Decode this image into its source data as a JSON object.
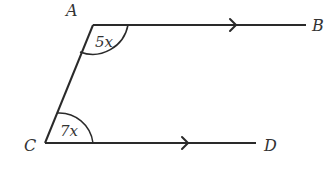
{
  "diagram": {
    "type": "geometry-parallel-lines",
    "points": {
      "A": {
        "label": "A",
        "x": 93,
        "y": 25
      },
      "B": {
        "label": "B",
        "x": 306,
        "y": 25
      },
      "C": {
        "label": "C",
        "x": 45,
        "y": 143
      },
      "D": {
        "label": "D",
        "x": 256,
        "y": 143
      }
    },
    "segments": [
      {
        "from": "A",
        "to": "B",
        "arrow": true
      },
      {
        "from": "C",
        "to": "D",
        "arrow": true
      },
      {
        "from": "A",
        "to": "C",
        "arrow": false
      }
    ],
    "angles": {
      "at_A": {
        "label": "5x",
        "vertex": "A"
      },
      "at_C": {
        "label": "7x",
        "vertex": "C"
      }
    },
    "stroke_color": "#2a2a2a",
    "label_color": "#333333"
  }
}
